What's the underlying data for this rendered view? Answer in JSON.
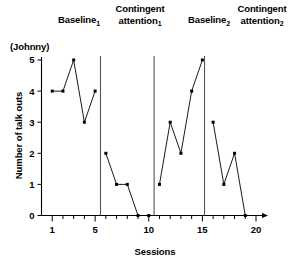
{
  "subject": "(Johnny)",
  "axes": {
    "y_title": "Number of talk outs",
    "x_title": "Sessions",
    "y_ticks": [
      "0",
      "1",
      "2",
      "3",
      "4",
      "5"
    ],
    "x_ticks": [
      "1",
      "5",
      "10",
      "15",
      "20"
    ]
  },
  "phases": [
    {
      "name": "Baseline",
      "sub": "1"
    },
    {
      "name": "Contingent attention",
      "sub": "1"
    },
    {
      "name": "Baseline",
      "sub": "2"
    },
    {
      "name": "Contingent attention",
      "sub": "2"
    }
  ],
  "chart_data": {
    "type": "line",
    "title": "",
    "subtitle": "(Johnny)",
    "xlabel": "Sessions",
    "ylabel": "Number of talk outs",
    "xlim": [
      0,
      20
    ],
    "ylim": [
      0,
      5
    ],
    "grid": false,
    "legend": "none",
    "x_tick_labels": [
      1,
      5,
      10,
      15,
      20
    ],
    "y_tick_labels": [
      0,
      1,
      2,
      3,
      4,
      5
    ],
    "phase_dividers_at_x": [
      5.5,
      10.5,
      15.2
    ],
    "annotations": [
      "Baseline₁",
      "Contingent attention₁",
      "Baseline₂",
      "Contingent attention₂"
    ],
    "series": [
      {
        "name": "Baseline 1",
        "x": [
          1,
          2,
          3,
          4,
          5
        ],
        "values": [
          4,
          4,
          5,
          3,
          4
        ]
      },
      {
        "name": "Contingent attention 1",
        "x": [
          6,
          7,
          8,
          9,
          10
        ],
        "values": [
          2,
          1,
          1,
          0,
          0
        ]
      },
      {
        "name": "Baseline 2",
        "x": [
          11,
          12,
          13,
          14,
          15
        ],
        "values": [
          1,
          3,
          2,
          4,
          5
        ]
      },
      {
        "name": "Contingent attention 2",
        "x": [
          16,
          17,
          18,
          19
        ],
        "values": [
          3,
          1,
          2,
          0
        ]
      }
    ]
  }
}
